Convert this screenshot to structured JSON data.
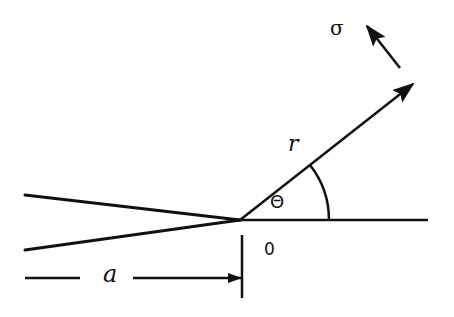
{
  "diagram": {
    "labels": {
      "stress": "σ",
      "radius": "r",
      "angle": "Θ",
      "origin": "0",
      "crack_length": "a"
    },
    "geometry": {
      "crack_tip": [
        240,
        220
      ],
      "upper_crack_face": [
        [
          25,
          195
        ],
        [
          240,
          220
        ]
      ],
      "lower_crack_face": [
        [
          25,
          250
        ],
        [
          240,
          220
        ]
      ],
      "x_axis": [
        [
          240,
          220
        ],
        [
          428,
          220
        ]
      ],
      "radial_line": [
        [
          240,
          220
        ],
        [
          413,
          83
        ]
      ],
      "stress_arrow": [
        [
          400,
          67
        ],
        [
          366,
          24
        ]
      ],
      "crack_length_marker_x": 242
    },
    "colors": {
      "ink": "#111111",
      "background": "#ffffff"
    }
  }
}
